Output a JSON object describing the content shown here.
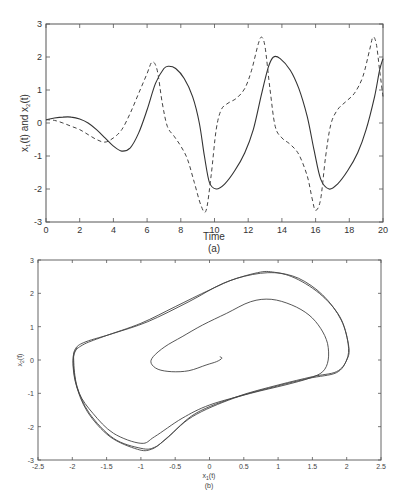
{
  "chart_data": [
    {
      "id": "a",
      "type": "line",
      "caption": "(a)",
      "xlabel": "Time",
      "ylabel": "x1(t) and x2(t)",
      "xlim": [
        0,
        20
      ],
      "ylim": [
        -3,
        3
      ],
      "xticks": [
        0,
        2,
        4,
        6,
        8,
        10,
        12,
        14,
        16,
        18,
        20
      ],
      "yticks": [
        -3,
        -2,
        -1,
        0,
        1,
        2,
        3
      ],
      "grid": false,
      "legend": "none",
      "series": [
        {
          "name": "x1(t)",
          "style": "solid",
          "points": [
            [
              0,
              0.1
            ],
            [
              0.5,
              0.15
            ],
            [
              1,
              0.18
            ],
            [
              1.5,
              0.18
            ],
            [
              2,
              0.12
            ],
            [
              2.5,
              0.0
            ],
            [
              3,
              -0.2
            ],
            [
              3.5,
              -0.45
            ],
            [
              4,
              -0.7
            ],
            [
              4.5,
              -0.85
            ],
            [
              5,
              -0.75
            ],
            [
              5.5,
              -0.3
            ],
            [
              6,
              0.4
            ],
            [
              6.5,
              1.2
            ],
            [
              7,
              1.65
            ],
            [
              7.3,
              1.72
            ],
            [
              7.7,
              1.65
            ],
            [
              8.2,
              1.35
            ],
            [
              8.7,
              0.8
            ],
            [
              9.1,
              0.0
            ],
            [
              9.4,
              -1.0
            ],
            [
              9.7,
              -1.8
            ],
            [
              10.1,
              -2.0
            ],
            [
              10.6,
              -1.85
            ],
            [
              11.2,
              -1.45
            ],
            [
              11.8,
              -0.9
            ],
            [
              12.3,
              -0.2
            ],
            [
              12.8,
              0.9
            ],
            [
              13.2,
              1.7
            ],
            [
              13.5,
              2.0
            ],
            [
              13.9,
              1.95
            ],
            [
              14.5,
              1.6
            ],
            [
              15.0,
              1.05
            ],
            [
              15.5,
              0.2
            ],
            [
              15.9,
              -0.8
            ],
            [
              16.3,
              -1.7
            ],
            [
              16.8,
              -2.0
            ],
            [
              17.3,
              -1.85
            ],
            [
              17.9,
              -1.45
            ],
            [
              18.5,
              -0.9
            ],
            [
              19.0,
              -0.2
            ],
            [
              19.5,
              0.8
            ],
            [
              19.8,
              1.6
            ],
            [
              20,
              1.95
            ]
          ]
        },
        {
          "name": "x2(t)",
          "style": "dashed",
          "points": [
            [
              0,
              0.1
            ],
            [
              0.5,
              0.08
            ],
            [
              1,
              0.0
            ],
            [
              1.5,
              -0.1
            ],
            [
              2,
              -0.2
            ],
            [
              2.5,
              -0.35
            ],
            [
              3,
              -0.5
            ],
            [
              3.5,
              -0.58
            ],
            [
              4,
              -0.45
            ],
            [
              4.5,
              -0.2
            ],
            [
              5,
              0.3
            ],
            [
              5.5,
              0.9
            ],
            [
              6,
              1.5
            ],
            [
              6.3,
              1.85
            ],
            [
              6.6,
              1.6
            ],
            [
              6.9,
              0.6
            ],
            [
              7.2,
              -0.1
            ],
            [
              7.6,
              -0.4
            ],
            [
              8,
              -0.7
            ],
            [
              8.4,
              -1.1
            ],
            [
              8.8,
              -1.8
            ],
            [
              9.2,
              -2.5
            ],
            [
              9.5,
              -2.65
            ],
            [
              9.8,
              -1.6
            ],
            [
              10.1,
              -0.2
            ],
            [
              10.4,
              0.4
            ],
            [
              10.8,
              0.6
            ],
            [
              11.3,
              0.75
            ],
            [
              11.8,
              1.05
            ],
            [
              12.2,
              1.6
            ],
            [
              12.6,
              2.4
            ],
            [
              12.8,
              2.6
            ],
            [
              13.0,
              2.3
            ],
            [
              13.3,
              1.0
            ],
            [
              13.6,
              -0.1
            ],
            [
              14.0,
              -0.45
            ],
            [
              14.5,
              -0.65
            ],
            [
              15.0,
              -0.95
            ],
            [
              15.5,
              -1.6
            ],
            [
              15.8,
              -2.3
            ],
            [
              16.0,
              -2.65
            ],
            [
              16.3,
              -2.3
            ],
            [
              16.6,
              -1.0
            ],
            [
              16.9,
              -0.05
            ],
            [
              17.3,
              0.4
            ],
            [
              17.8,
              0.65
            ],
            [
              18.3,
              0.9
            ],
            [
              18.8,
              1.4
            ],
            [
              19.2,
              2.2
            ],
            [
              19.4,
              2.6
            ],
            [
              19.6,
              2.4
            ],
            [
              19.8,
              1.6
            ],
            [
              20,
              0.8
            ]
          ]
        }
      ]
    },
    {
      "id": "b",
      "type": "line",
      "caption": "(b)",
      "xlabel": "x1(t)",
      "ylabel": "x2(t)",
      "xlim": [
        -2.5,
        2.5
      ],
      "ylim": [
        -3,
        3
      ],
      "xticks": [
        -2.5,
        -2,
        -1.5,
        -1,
        -0.5,
        0,
        0.5,
        1,
        1.5,
        2,
        2.5
      ],
      "yticks": [
        -3,
        -2,
        -1,
        0,
        1,
        2,
        3
      ],
      "grid": false,
      "legend": "none",
      "series": [
        {
          "name": "phase trajectory (x1 vs x2)",
          "style": "solid",
          "points": [
            [
              0.15,
              0.1
            ],
            [
              0.18,
              0.05
            ],
            [
              0.1,
              -0.05
            ],
            [
              -0.05,
              -0.15
            ],
            [
              -0.3,
              -0.32
            ],
            [
              -0.55,
              -0.35
            ],
            [
              -0.75,
              -0.28
            ],
            [
              -0.85,
              -0.1
            ],
            [
              -0.82,
              0.1
            ],
            [
              -0.65,
              0.4
            ],
            [
              -0.4,
              0.7
            ],
            [
              -0.1,
              1.05
            ],
            [
              0.25,
              1.4
            ],
            [
              0.6,
              1.75
            ],
            [
              0.9,
              1.82
            ],
            [
              1.2,
              1.65
            ],
            [
              1.45,
              1.35
            ],
            [
              1.62,
              0.95
            ],
            [
              1.72,
              0.5
            ],
            [
              1.73,
              0.0
            ],
            [
              1.65,
              -0.35
            ],
            [
              1.45,
              -0.55
            ],
            [
              1.1,
              -0.75
            ],
            [
              0.6,
              -1.0
            ],
            [
              0.0,
              -1.35
            ],
            [
              -0.4,
              -1.75
            ],
            [
              -0.8,
              -2.3
            ],
            [
              -1.0,
              -2.5
            ],
            [
              -1.4,
              -2.2
            ],
            [
              -1.7,
              -1.6
            ],
            [
              -1.9,
              -1.0
            ],
            [
              -1.98,
              -0.3
            ],
            [
              -1.97,
              0.2
            ],
            [
              -1.85,
              0.45
            ],
            [
              -1.55,
              0.7
            ],
            [
              -1.0,
              1.1
            ],
            [
              -0.5,
              1.6
            ],
            [
              0.0,
              2.1
            ],
            [
              0.4,
              2.45
            ],
            [
              0.85,
              2.62
            ],
            [
              1.2,
              2.5
            ],
            [
              1.6,
              2.0
            ],
            [
              1.9,
              1.3
            ],
            [
              2.02,
              0.5
            ],
            [
              2.0,
              0.0
            ],
            [
              1.85,
              -0.35
            ],
            [
              1.5,
              -0.5
            ],
            [
              1.0,
              -0.75
            ],
            [
              0.4,
              -1.1
            ],
            [
              -0.2,
              -1.6
            ],
            [
              -0.6,
              -2.3
            ],
            [
              -0.8,
              -2.62
            ],
            [
              -1.0,
              -2.65
            ],
            [
              -1.4,
              -2.35
            ],
            [
              -1.75,
              -1.6
            ],
            [
              -1.93,
              -0.8
            ],
            [
              -1.98,
              0.0
            ],
            [
              -1.95,
              0.35
            ],
            [
              -1.8,
              0.55
            ],
            [
              -1.4,
              0.8
            ],
            [
              -0.9,
              1.15
            ],
            [
              -0.3,
              1.75
            ],
            [
              0.2,
              2.3
            ],
            [
              0.7,
              2.62
            ],
            [
              0.95,
              2.63
            ],
            [
              1.3,
              2.45
            ],
            [
              1.65,
              1.95
            ],
            [
              1.92,
              1.2
            ],
            [
              2.03,
              0.4
            ],
            [
              2.0,
              0.0
            ],
            [
              1.85,
              -0.38
            ],
            [
              1.45,
              -0.55
            ],
            [
              0.95,
              -0.8
            ],
            [
              0.35,
              -1.15
            ],
            [
              -0.25,
              -1.7
            ],
            [
              -0.65,
              -2.4
            ],
            [
              -0.85,
              -2.68
            ],
            [
              -1.05,
              -2.68
            ],
            [
              -1.45,
              -2.3
            ],
            [
              -1.78,
              -1.55
            ],
            [
              -1.95,
              -0.7
            ],
            [
              -1.99,
              0.05
            ],
            [
              -1.93,
              0.38
            ]
          ]
        }
      ]
    }
  ]
}
